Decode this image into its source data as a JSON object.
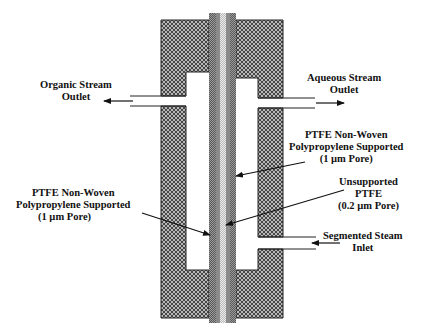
{
  "diagram": {
    "type": "membrane separator cross-section",
    "colors": {
      "housing_fill": "#9a9a9a",
      "housing_outline": "#222222",
      "membrane_outer": "#555555",
      "membrane_mid": "#8a8a8a",
      "membrane_center": "#d6d6d6",
      "arrow": "#111111"
    },
    "labels": {
      "organic_outlet": {
        "line1": "Organic Stream",
        "line2": "Outlet"
      },
      "aqueous_outlet": {
        "line1": "Aqueous Stream",
        "line2": "Outlet"
      },
      "ptfe_right": {
        "line1": "PTFE Non-Woven",
        "line2": "Polypropylene Supported",
        "line3": "(1 µm Pore)"
      },
      "ptfe_left": {
        "line1": "PTFE Non-Woven",
        "line2": "Polypropylene Supported",
        "line3": "(1 µm Pore)"
      },
      "unsupported": {
        "line1": "Unsupported",
        "line2": "PTFE",
        "line3": "(0.2 µm Pore)"
      },
      "segmented_inlet": {
        "line1": "Segmented Steam",
        "line2": "Inlet"
      }
    }
  }
}
